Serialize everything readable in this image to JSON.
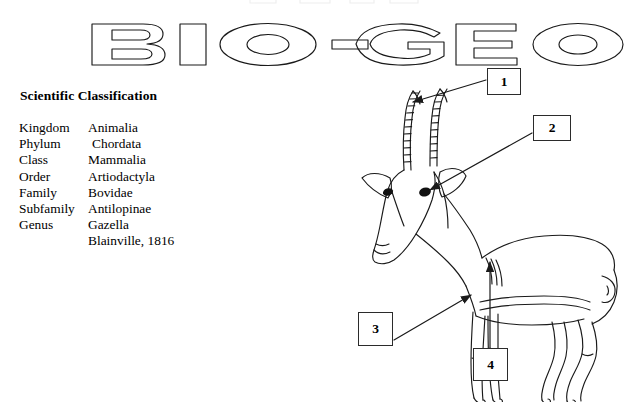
{
  "page": {
    "background_color": "#ffffff",
    "ink_color": "#1a1a1a",
    "width": 624,
    "height": 402
  },
  "banner": {
    "text": "BIO-GEO",
    "style": "outline-letters",
    "letters": [
      "B",
      "I",
      "O",
      "-",
      "G",
      "E",
      "O"
    ]
  },
  "classification": {
    "heading": "Scientific Classification",
    "rows": [
      {
        "rank": "Kingdom",
        "value": "Animalia"
      },
      {
        "rank": "Phylum",
        "value": "Chordata"
      },
      {
        "rank": "Class",
        "value": "Mammalia"
      },
      {
        "rank": "Order",
        "value": "Artiodactyla"
      },
      {
        "rank": "Family",
        "value": "Bovidae"
      },
      {
        "rank": "Subfamily",
        "value": "Antilopinae"
      },
      {
        "rank": "Genus",
        "value": "Gazella"
      },
      {
        "rank": "",
        "value": "Blainville, 1816"
      }
    ]
  },
  "figure": {
    "callouts": [
      {
        "id": "1",
        "label": "1",
        "target": "horn"
      },
      {
        "id": "2",
        "label": "2",
        "target": "eye"
      },
      {
        "id": "3",
        "label": "3",
        "target": "hoof"
      },
      {
        "id": "4",
        "label": "4",
        "target": "flank"
      }
    ]
  }
}
